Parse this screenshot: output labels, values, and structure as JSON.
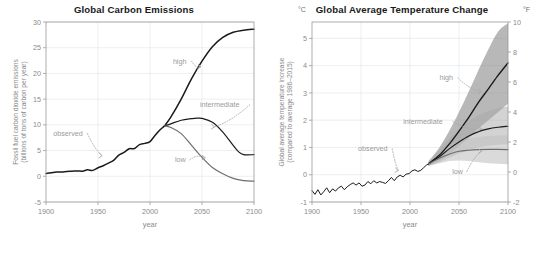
{
  "figure": {
    "caption": ""
  },
  "chart_data": [
    {
      "id": "emissions",
      "type": "line",
      "title": "Global Carbon Emissions",
      "xlabel": "year",
      "ylabel": "Fossil fuel carbon dioxide emissions (billions of tons of carbon per year)",
      "ylabel_line1": "Fossil fuel carbon dioxide emissions",
      "ylabel_line2": "(billions of tons of carbon per year)",
      "xlim": [
        1900,
        2100
      ],
      "ylim": [
        -5,
        30
      ],
      "xticks": [
        1900,
        1950,
        2000,
        2050,
        2100
      ],
      "yticks": [
        -5,
        0,
        5,
        10,
        15,
        20,
        25,
        30
      ],
      "grid": true,
      "legend": "annotations",
      "series": [
        {
          "name": "observed",
          "color": "#1a1a1a",
          "width": 1.5,
          "x": [
            1900,
            1905,
            1910,
            1915,
            1920,
            1925,
            1930,
            1935,
            1940,
            1945,
            1950,
            1955,
            1960,
            1965,
            1970,
            1975,
            1980,
            1985,
            1990,
            1995,
            2000,
            2005,
            2010,
            2014
          ],
          "values": [
            0.55,
            0.7,
            0.85,
            0.85,
            0.95,
            1.0,
            1.05,
            1.0,
            1.25,
            1.15,
            1.65,
            2.05,
            2.55,
            3.1,
            4.1,
            4.65,
            5.35,
            5.4,
            6.15,
            6.4,
            6.75,
            8.0,
            9.1,
            9.8
          ]
        },
        {
          "name": "high",
          "color": "#1a1a1a",
          "width": 1.5,
          "x": [
            2014,
            2020,
            2030,
            2040,
            2050,
            2060,
            2070,
            2080,
            2090,
            2100
          ],
          "values": [
            9.8,
            11.5,
            15.0,
            19.0,
            22.4,
            25.2,
            27.0,
            28.0,
            28.4,
            28.6
          ]
        },
        {
          "name": "intermediate",
          "color": "#1a1a1a",
          "width": 1.2,
          "x": [
            2014,
            2020,
            2030,
            2040,
            2045,
            2050,
            2060,
            2070,
            2080,
            2085,
            2090,
            2100
          ],
          "values": [
            9.8,
            10.2,
            10.9,
            11.2,
            11.3,
            11.25,
            10.5,
            8.6,
            6.0,
            4.8,
            4.2,
            4.2
          ]
        },
        {
          "name": "low",
          "color": "#6e6e6e",
          "width": 1.2,
          "x": [
            2014,
            2020,
            2030,
            2040,
            2050,
            2060,
            2070,
            2080,
            2090,
            2100
          ],
          "values": [
            9.8,
            9.5,
            8.3,
            6.0,
            3.7,
            1.7,
            0.5,
            -0.4,
            -0.85,
            -0.95
          ]
        }
      ],
      "annotations": [
        {
          "label": "high",
          "x": 2022,
          "y": 22.4,
          "tip_x": 2049,
          "tip_y": 21.3
        },
        {
          "label": "intermediate",
          "x": 2048,
          "y": 13.9,
          "tip_x": 2062,
          "tip_y": 9.6
        },
        {
          "label": "observed",
          "x": 1907,
          "y": 8.3,
          "tip_x": 1954,
          "tip_y": 4.0
        },
        {
          "label": "low",
          "x": 2024,
          "y": 3.2,
          "tip_x": 2053,
          "tip_y": 3.6
        }
      ]
    },
    {
      "id": "temperature",
      "type": "line",
      "title": "Global Average Temperature Change",
      "unit_left": "°C",
      "unit_right": "°F",
      "xlabel": "year",
      "ylabel": "Global average temperature increase (compared to average 1986–2015)",
      "ylabel_line1": "Global average temperature increase",
      "ylabel_line2": "(compared to average 1986–2015)",
      "xlim": [
        1900,
        2100
      ],
      "ylim": [
        -1,
        5.6
      ],
      "xticks": [
        1900,
        1950,
        2000,
        2050,
        2100
      ],
      "yticks": [
        -1,
        0,
        1,
        2,
        3,
        4,
        5
      ],
      "yticks_right": [
        -2,
        0,
        2,
        4,
        6,
        8,
        10
      ],
      "ylim_right": [
        -2,
        10
      ],
      "grid": true,
      "legend": "annotations",
      "series": [
        {
          "name": "observed",
          "color": "#1a1a1a",
          "width": 1.0,
          "x": [
            1900,
            1903,
            1906,
            1909,
            1912,
            1915,
            1918,
            1921,
            1924,
            1927,
            1930,
            1933,
            1936,
            1939,
            1942,
            1945,
            1948,
            1951,
            1954,
            1957,
            1960,
            1963,
            1966,
            1969,
            1972,
            1975,
            1978,
            1981,
            1984,
            1987,
            1990,
            1993,
            1996,
            1999,
            2002,
            2005,
            2008,
            2011,
            2014,
            2017,
            2019
          ],
          "values": [
            -0.58,
            -0.72,
            -0.55,
            -0.74,
            -0.62,
            -0.48,
            -0.66,
            -0.52,
            -0.6,
            -0.48,
            -0.42,
            -0.55,
            -0.44,
            -0.36,
            -0.3,
            -0.38,
            -0.3,
            -0.42,
            -0.38,
            -0.25,
            -0.33,
            -0.22,
            -0.3,
            -0.25,
            -0.28,
            -0.32,
            -0.22,
            -0.1,
            -0.22,
            -0.08,
            -0.02,
            -0.08,
            0.02,
            0.04,
            0.14,
            0.18,
            0.12,
            0.16,
            0.26,
            0.36,
            0.4
          ]
        },
        {
          "name": "high",
          "color": "#1a1a1a",
          "width": 1.4,
          "x": [
            2019,
            2030,
            2040,
            2050,
            2060,
            2070,
            2080,
            2090,
            2100
          ],
          "values": [
            0.4,
            0.72,
            1.12,
            1.6,
            2.1,
            2.66,
            3.15,
            3.65,
            4.1
          ]
        },
        {
          "name": "intermediate",
          "color": "#1a1a1a",
          "width": 1.1,
          "x": [
            2019,
            2030,
            2040,
            2050,
            2060,
            2070,
            2080,
            2090,
            2100
          ],
          "values": [
            0.4,
            0.66,
            0.95,
            1.2,
            1.42,
            1.58,
            1.68,
            1.74,
            1.78
          ]
        },
        {
          "name": "low",
          "color": "#6e6e6e",
          "width": 1.1,
          "x": [
            2019,
            2030,
            2040,
            2050,
            2060,
            2070,
            2080,
            2090,
            2100
          ],
          "values": [
            0.4,
            0.6,
            0.75,
            0.86,
            0.9,
            0.92,
            0.93,
            0.93,
            0.92
          ]
        }
      ],
      "bands": [
        {
          "name": "high-range",
          "color": "#8c8c8c",
          "opacity": 0.62,
          "x": [
            2019,
            2030,
            2040,
            2050,
            2060,
            2070,
            2080,
            2090,
            2100
          ],
          "upper": [
            0.5,
            1.0,
            1.6,
            2.3,
            3.05,
            3.85,
            4.6,
            5.25,
            5.55
          ],
          "lower": [
            0.32,
            0.5,
            0.75,
            1.05,
            1.35,
            1.7,
            2.0,
            2.3,
            2.6
          ]
        },
        {
          "name": "intermediate-range",
          "color": "#a8a8a8",
          "opacity": 0.5,
          "x": [
            2019,
            2030,
            2040,
            2050,
            2060,
            2070,
            2080,
            2090,
            2100
          ],
          "upper": [
            0.48,
            0.9,
            1.3,
            1.65,
            1.95,
            2.18,
            2.34,
            2.44,
            2.5
          ],
          "lower": [
            0.33,
            0.46,
            0.62,
            0.78,
            0.9,
            1.0,
            1.06,
            1.1,
            1.12
          ]
        },
        {
          "name": "low-range",
          "color": "#c4c4c4",
          "opacity": 0.62,
          "x": [
            2019,
            2030,
            2040,
            2050,
            2060,
            2070,
            2080,
            2090,
            2100
          ],
          "upper": [
            0.46,
            0.8,
            1.05,
            1.22,
            1.32,
            1.38,
            1.42,
            1.44,
            1.44
          ],
          "lower": [
            0.32,
            0.42,
            0.5,
            0.52,
            0.5,
            0.46,
            0.42,
            0.4,
            0.38
          ]
        }
      ],
      "annotations": [
        {
          "label": "high",
          "x": 2030,
          "y": 3.55,
          "tip_x": 2073,
          "tip_y": 3.05
        },
        {
          "label": "intermediate",
          "x": 1993,
          "y": 1.95,
          "tip_x": 2073,
          "tip_y": 1.68
        },
        {
          "label": "observed",
          "x": 1947,
          "y": 0.95,
          "tip_x": 1988,
          "tip_y": 0.16
        },
        {
          "label": "low",
          "x": 2043,
          "y": 0.12,
          "tip_x": 2073,
          "tip_y": 0.86
        }
      ]
    }
  ]
}
